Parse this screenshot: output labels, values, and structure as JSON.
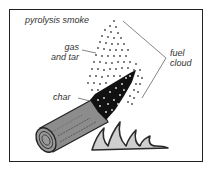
{
  "diagram": {
    "labels": {
      "pyrolysis_smoke": "pyrolysis smoke",
      "gas_line1": "gas",
      "gas_line2": "and tar",
      "char": "char",
      "fuel_line1": "fuel",
      "fuel_line2": "cloud"
    },
    "components": [
      "log",
      "char zone",
      "smoke particle cloud",
      "flames"
    ],
    "colors": {
      "frame": "#222222",
      "log_wood": "#8a8a8a",
      "char": "#111111",
      "flame_fill": "#cccccc",
      "flame_outline": "#333333",
      "dots": "#444444",
      "leader_lines": "#666666"
    }
  }
}
